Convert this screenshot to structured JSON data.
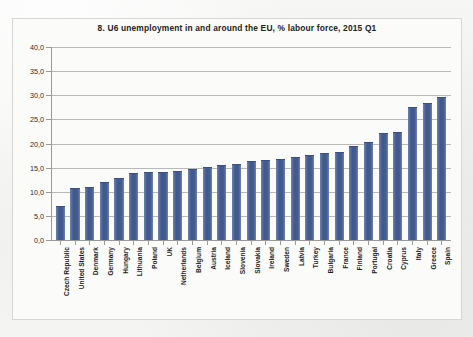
{
  "chart_data": {
    "type": "bar",
    "title": "8. U6 unemployment in and around the EU, % labour force, 2015 Q1",
    "xlabel": "",
    "ylabel": "",
    "ylim": [
      0,
      40
    ],
    "ytick_labels": [
      "40,0",
      "35,0",
      "30,0",
      "25,0",
      "20,0",
      "15,0",
      "10,0",
      "5,0",
      "0,0"
    ],
    "ytick_values": [
      40,
      35,
      30,
      25,
      20,
      15,
      10,
      5,
      0
    ],
    "grid": true,
    "legend": false,
    "bar_color": "#44598d",
    "categories": [
      "Czech Republic",
      "United States",
      "Denmark",
      "Germany",
      "Hungary",
      "Lithuania",
      "Poland",
      "UK",
      "Netherlands",
      "Belgium",
      "Austria",
      "Iceland",
      "Slovenia",
      "Slovakia",
      "Ireland",
      "Sweden",
      "Latvia",
      "Turkey",
      "Bulgaria",
      "France",
      "Finland",
      "Portugal",
      "Croatia",
      "Cyprus",
      "Italy",
      "Greece",
      "Spain"
    ],
    "values": [
      6.8,
      10.5,
      10.7,
      11.8,
      12.6,
      13.6,
      13.9,
      13.9,
      14.1,
      14.6,
      15.0,
      15.3,
      15.5,
      16.1,
      16.3,
      16.6,
      17.0,
      17.4,
      17.8,
      18.0,
      19.2,
      20.2,
      22.0,
      22.1,
      27.4,
      28.2,
      29.5
    ]
  }
}
